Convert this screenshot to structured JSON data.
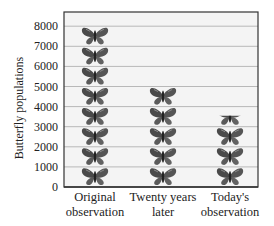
{
  "chart_data": {
    "type": "bar",
    "subtype": "pictograph",
    "title": "",
    "xlabel": "",
    "ylabel": "Butterfly populations",
    "categories": [
      "Original observation",
      "Twenty years later",
      "Today's observation"
    ],
    "category_lines": [
      [
        "Original",
        "observation"
      ],
      [
        "Twenty years",
        "later"
      ],
      [
        "Today's",
        "observation"
      ]
    ],
    "values": [
      8000,
      5000,
      3500
    ],
    "unit_per_icon": 1000,
    "icon": "butterfly-icon",
    "yticks": [
      0,
      1000,
      2000,
      3000,
      4000,
      5000,
      6000,
      7000,
      8000
    ],
    "ylim": [
      0,
      8700
    ],
    "grid": true,
    "legend": null
  },
  "colors": {
    "plot_background": "#f4f4f4",
    "gridline": "#b8b8b8",
    "axis": "#333333",
    "butterfly_dark": "#3a3a3a",
    "butterfly_mid": "#6e6e6e"
  }
}
